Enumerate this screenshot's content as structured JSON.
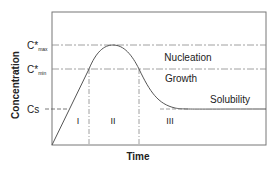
{
  "diagram": {
    "ylabel": "Concentration",
    "xlabel": "Time",
    "levels": [
      {
        "id": "cmax",
        "label": "C*",
        "sub": "max"
      },
      {
        "id": "cmin",
        "label": "C*",
        "sub": "min"
      },
      {
        "id": "cs",
        "label": "Cs",
        "sub": ""
      }
    ],
    "regions": [
      {
        "label": "Nucleation"
      },
      {
        "label": "Growth"
      },
      {
        "label": "Solubility"
      }
    ],
    "phases": [
      "I",
      "II",
      "III"
    ],
    "colors": {
      "axis": "#666666",
      "curve": "#555555",
      "dash": "#888888",
      "text": "#222222"
    }
  }
}
